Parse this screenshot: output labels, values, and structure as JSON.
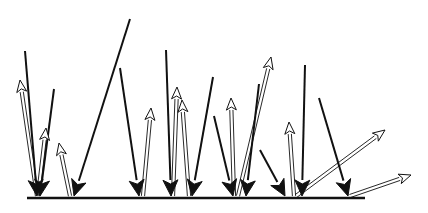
{
  "figure": {
    "width": 428,
    "height": 213,
    "background": "#ffffff",
    "ink": "#111111",
    "baseline": {
      "x1": 27,
      "y1": 198,
      "x2": 365,
      "y2": 198,
      "stroke_width": 2.5
    },
    "incident_arrows": [
      {
        "x1": 25,
        "y1": 51,
        "x2": 37,
        "y2": 196
      },
      {
        "x1": 54,
        "y1": 89,
        "x2": 40,
        "y2": 196
      },
      {
        "x1": 130,
        "y1": 19,
        "x2": 74,
        "y2": 196
      },
      {
        "x1": 120,
        "y1": 68,
        "x2": 139,
        "y2": 196
      },
      {
        "x1": 166,
        "y1": 50,
        "x2": 171,
        "y2": 196
      },
      {
        "x1": 213,
        "y1": 77,
        "x2": 192,
        "y2": 196
      },
      {
        "x1": 214,
        "y1": 116,
        "x2": 233,
        "y2": 196
      },
      {
        "x1": 259,
        "y1": 84,
        "x2": 246,
        "y2": 196
      },
      {
        "x1": 260,
        "y1": 150,
        "x2": 285,
        "y2": 196
      },
      {
        "x1": 305,
        "y1": 65,
        "x2": 302,
        "y2": 196
      },
      {
        "x1": 319,
        "y1": 98,
        "x2": 348,
        "y2": 196
      }
    ],
    "reflected_arrows": [
      {
        "x1": 37,
        "y1": 196,
        "x2": 20,
        "y2": 80
      },
      {
        "x1": 38,
        "y1": 196,
        "x2": 46,
        "y2": 128
      },
      {
        "x1": 70,
        "y1": 196,
        "x2": 59,
        "y2": 143
      },
      {
        "x1": 143,
        "y1": 196,
        "x2": 151,
        "y2": 108
      },
      {
        "x1": 173,
        "y1": 196,
        "x2": 177,
        "y2": 87
      },
      {
        "x1": 189,
        "y1": 196,
        "x2": 182,
        "y2": 100
      },
      {
        "x1": 234,
        "y1": 196,
        "x2": 231,
        "y2": 98
      },
      {
        "x1": 238,
        "y1": 196,
        "x2": 271,
        "y2": 57
      },
      {
        "x1": 294,
        "y1": 196,
        "x2": 289,
        "y2": 122
      },
      {
        "x1": 296,
        "y1": 196,
        "x2": 385,
        "y2": 130
      },
      {
        "x1": 350,
        "y1": 196,
        "x2": 411,
        "y2": 175
      }
    ]
  }
}
